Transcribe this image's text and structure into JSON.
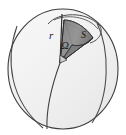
{
  "figure": {
    "type": "solid-angle-sphere-diagram",
    "labels": {
      "radius": "r",
      "area": "S",
      "solid_angle": "Ω"
    },
    "colors": {
      "sphere_fill": "#f1f1f1",
      "sphere_fill_lower": "#ececec",
      "outline": "#3a3a3a",
      "cone_fill": "#8d8d8d",
      "cone_fill_dark": "#6f6f6f",
      "cap_fill": "#dcdcdc",
      "background": "#ffffff",
      "label_color": "#1a1a1a"
    },
    "geometry": {
      "sphere_center_x": 63,
      "sphere_center_y": 68,
      "sphere_radius_x": 56,
      "sphere_radius_y": 62,
      "cone_apex_x": 60,
      "cone_apex_y": 63,
      "radius_line_top_x": 61,
      "radius_line_top_y": 14
    }
  }
}
